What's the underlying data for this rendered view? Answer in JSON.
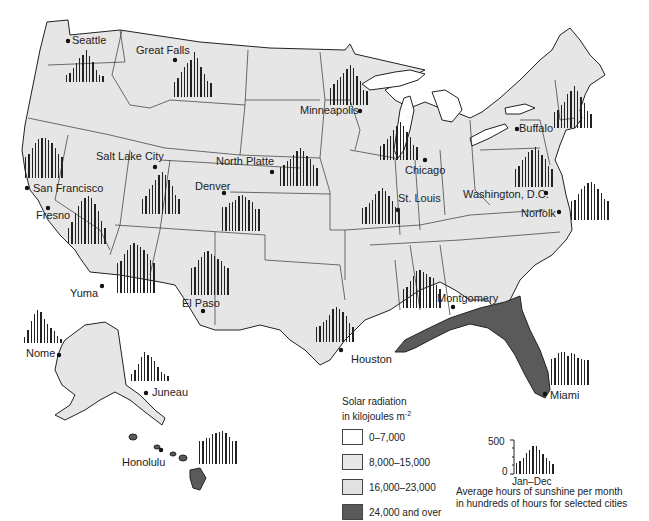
{
  "map": {
    "title": "Solar radiation and sunshine hours, United States",
    "colors": {
      "land": "#e6e6e6",
      "high_radiation": "#5a5a5a",
      "water": "#ffffff",
      "border": "#222222"
    }
  },
  "legend": {
    "title_line1": "Solar radiation",
    "title_line2": "in kilojoules m",
    "title_sup": "-2",
    "items": [
      {
        "label": "0–7,000",
        "color": "#ffffff"
      },
      {
        "label": "8,000–15,000",
        "color": "#e8e8e8"
      },
      {
        "label": "16,000–23,000",
        "color": "#e1e1e1"
      },
      {
        "label": "24,000 and over",
        "color": "#5a5a5a"
      }
    ]
  },
  "sample_chart": {
    "y_max_label": "500",
    "y_min_label": "0",
    "x_label": "Jan–Dec",
    "caption_line1": "Average hours of sunshine per month",
    "caption_line2": "in hundreds of hours for selected cities"
  },
  "cities": [
    {
      "name": "Seattle"
    },
    {
      "name": "Great Falls"
    },
    {
      "name": "Minneapolis"
    },
    {
      "name": "Salt Lake City"
    },
    {
      "name": "North Platte"
    },
    {
      "name": "Chicago"
    },
    {
      "name": "Buffalo"
    },
    {
      "name": "San Francisco"
    },
    {
      "name": "Fresno"
    },
    {
      "name": "Denver"
    },
    {
      "name": "St. Louis"
    },
    {
      "name": "Washington, D.C."
    },
    {
      "name": "Norfolk"
    },
    {
      "name": "Yuma"
    },
    {
      "name": "El Paso"
    },
    {
      "name": "Montgomery"
    },
    {
      "name": "Houston"
    },
    {
      "name": "Miami"
    },
    {
      "name": "Nome"
    },
    {
      "name": "Juneau"
    },
    {
      "name": "Honolulu"
    }
  ],
  "chart_data": {
    "type": "bar",
    "title": "Average hours of sunshine per month in hundreds of hours for selected cities",
    "xlabel": "Jan–Dec",
    "ylabel": "hours",
    "ylim": [
      0,
      500
    ],
    "categories": [
      "Jan",
      "Feb",
      "Mar",
      "Apr",
      "May",
      "Jun",
      "Jul",
      "Aug",
      "Sep",
      "Oct",
      "Nov",
      "Dec"
    ],
    "series": [
      {
        "name": "Sample",
        "values": [
          150,
          180,
          220,
          280,
          330,
          380,
          380,
          330,
          270,
          220,
          170,
          140
        ]
      },
      {
        "name": "Seattle",
        "values": [
          80,
          110,
          170,
          230,
          290,
          330,
          390,
          320,
          240,
          150,
          90,
          70
        ]
      },
      {
        "name": "Great Falls",
        "values": [
          140,
          170,
          230,
          270,
          310,
          340,
          410,
          360,
          270,
          210,
          150,
          130
        ]
      },
      {
        "name": "Minneapolis",
        "values": [
          160,
          190,
          230,
          260,
          300,
          330,
          370,
          340,
          270,
          220,
          140,
          130
        ]
      },
      {
        "name": "North Platte",
        "values": [
          190,
          200,
          240,
          260,
          300,
          340,
          370,
          340,
          290,
          260,
          200,
          180
        ]
      },
      {
        "name": "Chicago",
        "values": [
          130,
          150,
          190,
          220,
          280,
          310,
          350,
          310,
          260,
          210,
          140,
          120
        ]
      },
      {
        "name": "San Francisco",
        "values": [
          170,
          200,
          250,
          290,
          320,
          330,
          330,
          310,
          290,
          250,
          200,
          170
        ]
      },
      {
        "name": "Fresno",
        "values": [
          140,
          190,
          270,
          330,
          380,
          400,
          420,
          400,
          350,
          290,
          200,
          140
        ]
      },
      {
        "name": "Salt Lake City",
        "values": [
          140,
          170,
          230,
          270,
          320,
          360,
          390,
          360,
          320,
          260,
          180,
          140
        ]
      },
      {
        "name": "Denver",
        "values": [
          210,
          210,
          250,
          260,
          280,
          310,
          320,
          300,
          280,
          260,
          200,
          200
        ]
      },
      {
        "name": "St. Louis",
        "values": [
          150,
          160,
          200,
          230,
          280,
          310,
          340,
          310,
          260,
          220,
          160,
          140
        ]
      },
      {
        "name": "Washington, D.C.",
        "values": [
          140,
          160,
          210,
          230,
          270,
          290,
          310,
          290,
          250,
          220,
          160,
          140
        ]
      },
      {
        "name": "Norfolk",
        "values": [
          160,
          170,
          220,
          260,
          290,
          310,
          320,
          300,
          260,
          230,
          180,
          160
        ]
      },
      {
        "name": "Yuma",
        "values": [
          250,
          260,
          320,
          350,
          390,
          410,
          390,
          380,
          350,
          320,
          270,
          250
        ]
      },
      {
        "name": "El Paso",
        "values": [
          240,
          250,
          310,
          340,
          380,
          390,
          360,
          350,
          320,
          300,
          260,
          240
        ]
      },
      {
        "name": "Montgomery",
        "values": [
          160,
          180,
          230,
          270,
          310,
          320,
          300,
          290,
          260,
          250,
          190,
          160
        ]
      },
      {
        "name": "Houston",
        "values": [
          140,
          150,
          180,
          200,
          250,
          300,
          320,
          300,
          270,
          240,
          170,
          140
        ]
      },
      {
        "name": "Miami",
        "values": [
          220,
          230,
          270,
          280,
          280,
          250,
          270,
          260,
          230,
          220,
          210,
          210
        ]
      },
      {
        "name": "Nome",
        "values": [
          50,
          110,
          190,
          250,
          280,
          260,
          200,
          160,
          130,
          100,
          60,
          30
        ]
      },
      {
        "name": "Juneau",
        "values": [
          50,
          80,
          130,
          180,
          220,
          200,
          180,
          150,
          110,
          70,
          50,
          40
        ]
      },
      {
        "name": "Honolulu",
        "values": [
          210,
          210,
          240,
          240,
          270,
          280,
          290,
          300,
          280,
          250,
          210,
          210
        ]
      }
    ]
  }
}
